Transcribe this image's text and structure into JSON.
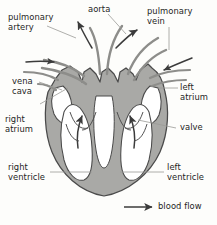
{
  "figure": {
    "type": "anatomical-diagram",
    "background_color": "#fdfdfb",
    "muscle_fill_color": "#a9a9a6",
    "chamber_fill_color": "#ffffff",
    "outline_color": "#4a4a4a",
    "arrow_color": "#3b3b3b",
    "leader_line_color": "#9a9a97",
    "text_color": "#1d1d1d"
  },
  "labels": {
    "aorta": "aorta",
    "pulmonary_artery": "pulmonary\nartery",
    "pulmonary_vein": "pulmonary\nvein",
    "vena_cava": "vena\ncava",
    "left_atrium": "left\natrium",
    "right_atrium": "right\natrium",
    "valve": "valve",
    "right_ventricle": "right\nventricle",
    "left_ventricle": "left\nventricle"
  },
  "legend": {
    "blood_flow_label": "blood flow",
    "arrow_icon": "right-arrow-icon"
  },
  "flow_arrows": [
    {
      "name": "aorta-outflow-arrow",
      "direction": "up-left",
      "region": "aorta"
    },
    {
      "name": "pulmonary-artery-outflow-arrow",
      "direction": "up-right",
      "region": "pulmonary artery"
    },
    {
      "name": "vena-cava-inflow-arrow",
      "direction": "right",
      "region": "vena cava"
    },
    {
      "name": "pulmonary-vein-inflow-arrow",
      "direction": "down-left",
      "region": "pulmonary vein"
    },
    {
      "name": "right-ventricle-arrow",
      "direction": "up",
      "region": "right ventricle"
    },
    {
      "name": "left-ventricle-arrow",
      "direction": "up",
      "region": "left ventricle"
    }
  ]
}
